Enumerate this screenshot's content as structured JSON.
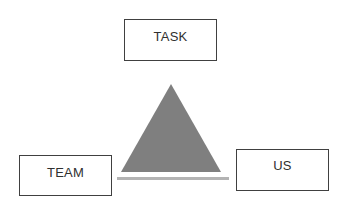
{
  "diagram": {
    "nodes": [
      {
        "id": "task",
        "label": "TASK",
        "position": "top"
      },
      {
        "id": "team",
        "label": "TEAM",
        "position": "bottom-left"
      },
      {
        "id": "us",
        "label": "US",
        "position": "bottom-right"
      }
    ],
    "center_shape": {
      "type": "triangle",
      "fill": "#7f7f7f"
    },
    "base_line": {
      "color": "#b0b0b0"
    }
  }
}
